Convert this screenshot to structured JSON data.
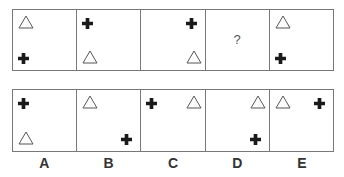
{
  "puzzle": {
    "sequence": [
      {
        "shapes": [
          {
            "type": "triangle",
            "pos": "top-left"
          },
          {
            "type": "cross",
            "pos": "bottom-left"
          }
        ]
      },
      {
        "shapes": [
          {
            "type": "cross",
            "pos": "top-left"
          },
          {
            "type": "triangle",
            "pos": "bottom-left"
          }
        ]
      },
      {
        "shapes": [
          {
            "type": "cross",
            "pos": "top-right"
          },
          {
            "type": "triangle",
            "pos": "bottom-right"
          }
        ]
      },
      {
        "unknown": "?"
      },
      {
        "shapes": [
          {
            "type": "triangle",
            "pos": "top-left"
          },
          {
            "type": "cross",
            "pos": "bottom-left"
          }
        ]
      }
    ],
    "options": [
      {
        "label": "A",
        "shapes": [
          {
            "type": "cross",
            "pos": "top-left"
          },
          {
            "type": "triangle",
            "pos": "bottom-left"
          }
        ]
      },
      {
        "label": "B",
        "shapes": [
          {
            "type": "triangle",
            "pos": "top-left"
          },
          {
            "type": "cross",
            "pos": "bottom-right"
          }
        ]
      },
      {
        "label": "C",
        "shapes": [
          {
            "type": "cross",
            "pos": "top-left"
          },
          {
            "type": "triangle",
            "pos": "top-right"
          }
        ]
      },
      {
        "label": "D",
        "shapes": [
          {
            "type": "triangle",
            "pos": "top-right"
          },
          {
            "type": "cross",
            "pos": "bottom-right"
          }
        ]
      },
      {
        "label": "E",
        "shapes": [
          {
            "type": "triangle",
            "pos": "top-left"
          },
          {
            "type": "cross",
            "pos": "top-right"
          }
        ]
      }
    ]
  },
  "labels": [
    "A",
    "B",
    "C",
    "D",
    "E"
  ],
  "question_mark": "?",
  "colors": {
    "border": "#777777",
    "cross": "#1a1a1a",
    "triangle_stroke": "#555555"
  }
}
